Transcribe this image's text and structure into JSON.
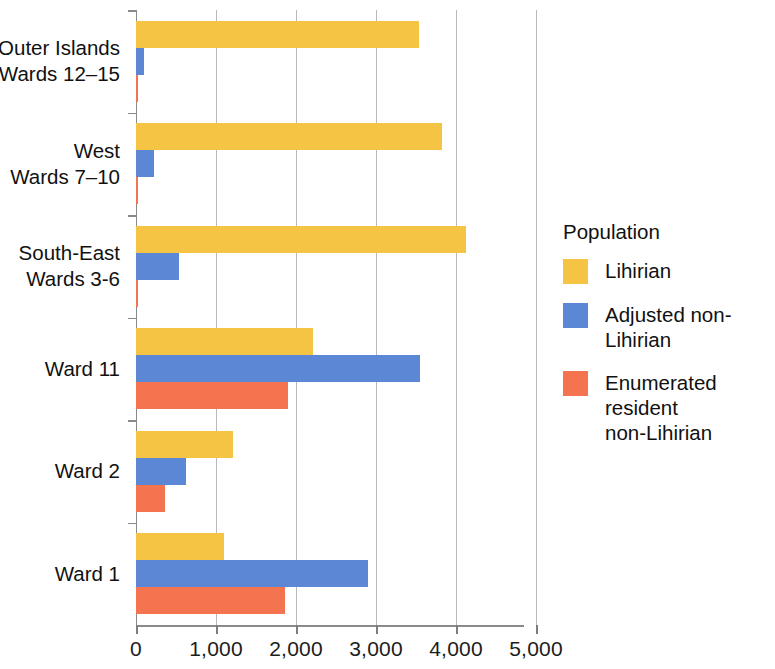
{
  "chart_data": {
    "type": "bar",
    "orientation": "horizontal",
    "title": "",
    "xlabel": "",
    "ylabel": "",
    "xlim": [
      0,
      5000
    ],
    "grid": true,
    "legend_position": "right",
    "legend_title": "Population",
    "xticks": [
      0,
      1000,
      2000,
      3000,
      4000,
      5000
    ],
    "xtick_labels": [
      "0",
      "1,000",
      "2,000",
      "3,000",
      "4,000",
      "5,000"
    ],
    "categories": [
      "Ward 1",
      "Ward 2",
      "Ward 11",
      "South-East\nWards 3-6",
      "West\nWards 7–10",
      "Outer Islands\nWards 12–15"
    ],
    "series": [
      {
        "name": "Lihirian",
        "color": "#F6C445",
        "values": [
          1100,
          1210,
          2210,
          4125,
          3825,
          3540
        ]
      },
      {
        "name": "Adjusted non-Lihirian",
        "color": "#5B87D4",
        "values": [
          2900,
          625,
          3550,
          540,
          225,
          100
        ]
      },
      {
        "name": "Enumerated resident\nnon-Lihirian",
        "color": "#F4744F",
        "values": [
          1860,
          360,
          1900,
          25,
          20,
          15
        ]
      }
    ]
  },
  "legend": {
    "title": "Population",
    "items": [
      {
        "label": "Lihirian",
        "color": "#F6C445"
      },
      {
        "label": "Adjusted non-Lihirian",
        "color": "#5B87D4"
      },
      {
        "label": "Enumerated resident\nnon-Lihirian",
        "color": "#F4744F"
      }
    ]
  }
}
